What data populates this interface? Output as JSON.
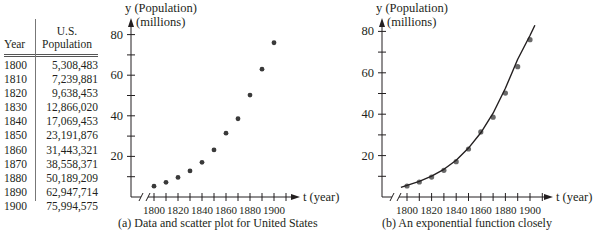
{
  "table": {
    "headers": {
      "year": "Year",
      "population_line1": "U.S.",
      "population_line2": "Population"
    },
    "rows": [
      {
        "year": "1800",
        "population": "5,308,483"
      },
      {
        "year": "1810",
        "population": "7,239,881"
      },
      {
        "year": "1820",
        "population": "9,638,453"
      },
      {
        "year": "1830",
        "population": "12,866,020"
      },
      {
        "year": "1840",
        "population": "17,069,453"
      },
      {
        "year": "1850",
        "population": "23,191,876"
      },
      {
        "year": "1860",
        "population": "31,443,321"
      },
      {
        "year": "1870",
        "population": "38,558,371"
      },
      {
        "year": "1880",
        "population": "50,189,209"
      },
      {
        "year": "1890",
        "population": "62,947,714"
      },
      {
        "year": "1900",
        "population": "75,994,575"
      }
    ]
  },
  "captions": {
    "a": "(a)   Data and scatter plot for United States",
    "b": "(b)   An exponential function closely"
  },
  "chart_data": [
    {
      "type": "scatter",
      "title": "(a) Data and scatter plot for United States",
      "xlabel": "t (year)",
      "ylabel": "y (Population) (millions)",
      "ylabel_line1": "y (Population)",
      "ylabel_line2": "(millions)",
      "x": [
        1800,
        1810,
        1820,
        1830,
        1840,
        1850,
        1860,
        1870,
        1880,
        1890,
        1900
      ],
      "y": [
        5.308,
        7.24,
        9.638,
        12.866,
        17.069,
        23.192,
        31.443,
        38.558,
        50.189,
        62.948,
        75.995
      ],
      "xticks": [
        "1800",
        "1820",
        "1840",
        "1860",
        "1880",
        "1900"
      ],
      "yticks": [
        "20",
        "40",
        "60",
        "80"
      ],
      "xlim": [
        1790,
        1910
      ],
      "ylim": [
        0,
        85
      ],
      "grid": false,
      "axis_break": true
    },
    {
      "type": "line",
      "title": "(b) An exponential function closely",
      "xlabel": "t (year)",
      "ylabel": "y (Population) (millions)",
      "ylabel_line1": "y (Population)",
      "ylabel_line2": "(millions)",
      "series": [
        {
          "name": "data",
          "kind": "scatter",
          "x": [
            1800,
            1810,
            1820,
            1830,
            1840,
            1850,
            1860,
            1870,
            1880,
            1890,
            1900
          ],
          "y": [
            5.308,
            7.24,
            9.638,
            12.866,
            17.069,
            23.192,
            31.443,
            38.558,
            50.189,
            62.948,
            75.995
          ]
        },
        {
          "name": "exponential fit",
          "kind": "line",
          "x": [
            1795,
            1800,
            1810,
            1820,
            1830,
            1840,
            1850,
            1860,
            1870,
            1880,
            1890,
            1900,
            1904
          ],
          "y": [
            4.7,
            5.6,
            7.6,
            10.1,
            13.4,
            17.8,
            23.6,
            31.0,
            40.5,
            52.5,
            66.5,
            78.0,
            83.0
          ]
        }
      ],
      "xticks": [
        "1800",
        "1820",
        "1840",
        "1860",
        "1880",
        "1900"
      ],
      "yticks": [
        "20",
        "40",
        "60",
        "80"
      ],
      "xlim": [
        1790,
        1910
      ],
      "ylim": [
        0,
        85
      ],
      "grid": false,
      "axis_break": true
    }
  ]
}
